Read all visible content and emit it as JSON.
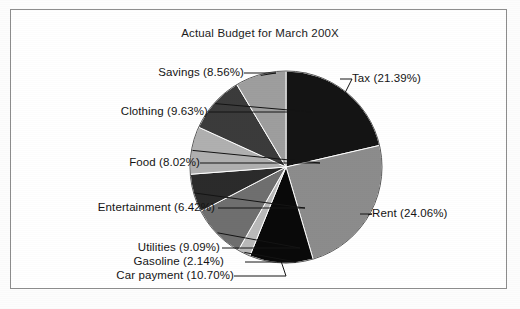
{
  "chart_data": {
    "type": "pie",
    "title": "Actual Budget for March 200X",
    "xlabel": "",
    "ylabel": "",
    "legend_position": "none",
    "labels_position": "outside-with-leader-lines",
    "grid": false,
    "start_angle_deg": 0,
    "direction": "clockwise",
    "categories": [
      "Tax",
      "Rent",
      "Car payment",
      "Gasoline",
      "Utilities",
      "Entertainment",
      "Food",
      "Clothing",
      "Savings"
    ],
    "values": [
      21.39,
      24.06,
      10.7,
      2.14,
      9.09,
      6.42,
      8.02,
      9.63,
      8.56
    ],
    "value_unit": "percent",
    "total": 100.01,
    "slices": [
      {
        "name": "Tax",
        "percent": 21.39,
        "label": "Tax (21.39%)",
        "color": "#141414"
      },
      {
        "name": "Rent",
        "percent": 24.06,
        "label": "Rent (24.06%)",
        "color": "#8c8c8c"
      },
      {
        "name": "Car payment",
        "percent": 10.7,
        "label": "Car payment (10.70%)",
        "color": "#090909"
      },
      {
        "name": "Gasoline",
        "percent": 2.14,
        "label": "Gasoline (2.14%)",
        "color": "#b9b9b9"
      },
      {
        "name": "Utilities",
        "percent": 9.09,
        "label": "Utilities (9.09%)",
        "color": "#6f6f6f"
      },
      {
        "name": "Entertainment",
        "percent": 6.42,
        "label": "Entertainment (6.42%)",
        "color": "#2b2b2b"
      },
      {
        "name": "Food",
        "percent": 8.02,
        "label": "Food (8.02%)",
        "color": "#b0b0b0"
      },
      {
        "name": "Clothing",
        "percent": 9.63,
        "label": "Clothing (9.63%)",
        "color": "#3b3b3b"
      },
      {
        "name": "Savings",
        "percent": 8.56,
        "label": "Savings (8.56%)",
        "color": "#9e9e9e"
      }
    ]
  },
  "figure": {
    "border_color": "#8d8d8d",
    "background": "#ffffff",
    "text_color": "#141414"
  }
}
